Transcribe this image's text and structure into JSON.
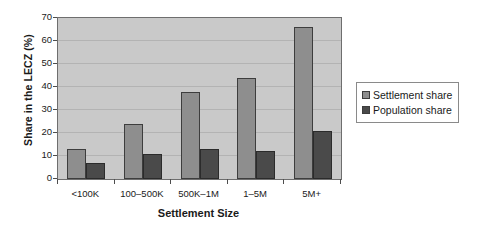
{
  "chart_data": {
    "type": "bar",
    "title": "",
    "xlabel": "Settlement Size",
    "ylabel": "Share in the LECZ (%)",
    "categories": [
      "<100K",
      "100–500K",
      "500K–1M",
      "1–5M",
      "5M+"
    ],
    "series": [
      {
        "name": "Settlement share",
        "color": "#8e8e8e",
        "values": [
          13,
          24,
          38,
          44,
          66
        ]
      },
      {
        "name": "Population share",
        "color": "#4a4a4a",
        "values": [
          7,
          11,
          13,
          12,
          21
        ]
      }
    ],
    "ylim": [
      0,
      70
    ],
    "ytick_step": 10,
    "yticks": [
      0,
      10,
      20,
      30,
      40,
      50,
      60,
      70
    ],
    "grid": "horizontal",
    "legend_position": "right",
    "plot_background": "#c9c9c9",
    "gridline_color": "#b3b3b3"
  }
}
